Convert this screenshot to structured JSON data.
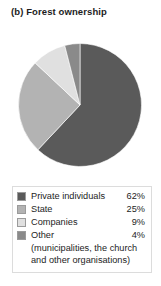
{
  "title": "(b) Forest ownership",
  "chart_data": {
    "type": "pie",
    "title": "(b) Forest ownership",
    "xlabel": "",
    "ylabel": "",
    "legend_position": "bottom",
    "grid": false,
    "categories": [
      "Private individuals",
      "State",
      "Companies",
      "Other"
    ],
    "values": [
      62,
      25,
      9,
      4
    ],
    "value_labels": [
      "62%",
      "25%",
      "9%",
      "4%"
    ],
    "unit": "%",
    "colors": [
      "#5a5a5a",
      "#b3b3b3",
      "#e0e0e0",
      "#8a8a8a"
    ],
    "start_angle_deg": 0,
    "direction": "clockwise",
    "note": "Other = municipalities, the church and other organisations"
  },
  "legend": {
    "rows": [
      {
        "label": "Private individuals",
        "value": "62%",
        "color": "#5a5a5a",
        "swatch_name": "legend-swatch-private-individuals"
      },
      {
        "label": "State",
        "value": "25%",
        "color": "#b3b3b3",
        "swatch_name": "legend-swatch-state"
      },
      {
        "label": "Companies",
        "value": "9%",
        "color": "#e0e0e0",
        "swatch_name": "legend-swatch-companies"
      },
      {
        "label": "Other",
        "value": "4%",
        "color": "#8a8a8a",
        "swatch_name": "legend-swatch-other"
      }
    ],
    "note_line1": "(municipalities, the church",
    "note_line2": "and other organisations)"
  }
}
